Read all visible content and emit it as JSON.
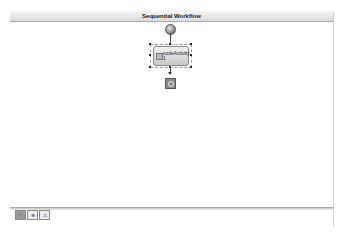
{
  "designer": {
    "title": "Sequential Workflow",
    "start_icon": "workflow-start-icon",
    "end_icon": "workflow-end-icon"
  },
  "activity": {
    "name_line1": "codeActivity",
    "name_line2": "1",
    "icon": "code-activity-icon"
  },
  "bottom_toolbar": {
    "buttons": [
      {
        "name": "view-workflow-button",
        "glyph": "⁞",
        "active": true
      },
      {
        "name": "view-cancel-handlers-button",
        "glyph": "⊗",
        "active": false
      },
      {
        "name": "view-fault-handlers-button",
        "glyph": "⚠",
        "active": false
      }
    ]
  }
}
